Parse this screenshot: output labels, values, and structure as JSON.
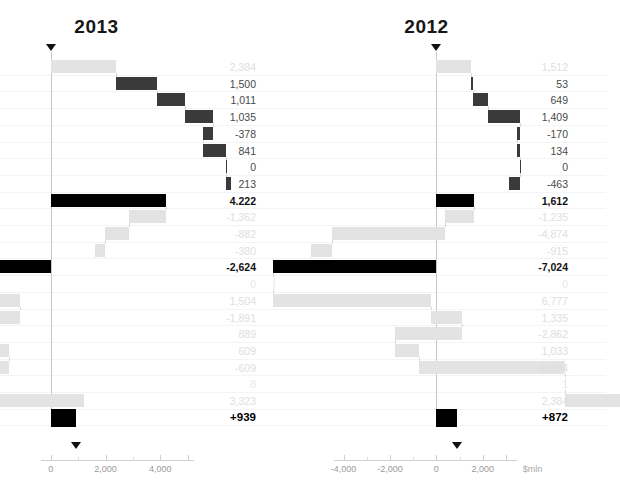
{
  "chart_data": {
    "type": "bar",
    "title": "",
    "subtitle": "",
    "xlabel": "$mln",
    "ylabel": "",
    "grid": true,
    "legend_position": "none",
    "panels": [
      {
        "name": "2013",
        "year_label": "2013",
        "axis_unit": "$mln",
        "xlim": [
          -1200,
          5200
        ],
        "xticks": [
          0,
          2000,
          4000
        ],
        "xtick_labels": [
          "0",
          "2,000",
          "4,000"
        ],
        "start_marker_value": 939,
        "total_label": "+939",
        "rows": [
          {
            "value": 2384,
            "label": "2,384",
            "style": "faint",
            "kind": "bar"
          },
          {
            "value": 1500,
            "label": "1,500",
            "style": "normal",
            "kind": "bar"
          },
          {
            "value": 1011,
            "label": "1,011",
            "style": "normal",
            "kind": "bar"
          },
          {
            "value": 1035,
            "label": "1,035",
            "style": "normal",
            "kind": "bar"
          },
          {
            "value": -378,
            "label": "-378",
            "style": "normal",
            "kind": "bar"
          },
          {
            "value": 841,
            "label": "841",
            "style": "normal",
            "kind": "bar"
          },
          {
            "value": 0,
            "label": "0",
            "style": "normal",
            "kind": "bar"
          },
          {
            "value": 213,
            "label": "213",
            "style": "normal",
            "kind": "bar"
          },
          {
            "value": 4222,
            "label": "4.222",
            "style": "total",
            "kind": "subtotal"
          },
          {
            "value": -1362,
            "label": "-1,362",
            "style": "faint",
            "kind": "bar"
          },
          {
            "value": -882,
            "label": "-882",
            "style": "faint",
            "kind": "bar"
          },
          {
            "value": -380,
            "label": "-380",
            "style": "faint",
            "kind": "bar"
          },
          {
            "value": -2624,
            "label": "-2,624",
            "style": "total",
            "kind": "subtotal"
          },
          {
            "value": 0,
            "label": "0",
            "style": "faint2",
            "kind": "bar"
          },
          {
            "value": 1504,
            "label": "1,504",
            "style": "faint",
            "kind": "bar"
          },
          {
            "value": -1891,
            "label": "-1,891",
            "style": "faint",
            "kind": "bar"
          },
          {
            "value": 889,
            "label": "889",
            "style": "faint",
            "kind": "bar"
          },
          {
            "value": 609,
            "label": "609",
            "style": "faint",
            "kind": "bar"
          },
          {
            "value": -609,
            "label": "-609",
            "style": "faint",
            "kind": "bar"
          },
          {
            "value": 8,
            "label": "8",
            "style": "faint2",
            "kind": "bar"
          },
          {
            "value": 3323,
            "label": "3,323",
            "style": "faint",
            "kind": "bar"
          },
          {
            "value": 939,
            "label": "+939",
            "style": "grand",
            "kind": "total"
          }
        ]
      },
      {
        "name": "2012",
        "year_label": "2012",
        "axis_unit": "$mln",
        "xlim": [
          -5400,
          3000
        ],
        "xticks": [
          -4000,
          -2000,
          0,
          2000
        ],
        "xtick_labels": [
          "-4,000",
          "-2,000",
          "0",
          "2,000"
        ],
        "start_marker_value": 872,
        "total_label": "+872",
        "rows": [
          {
            "value": 1512,
            "label": "1,512",
            "style": "faint",
            "kind": "bar"
          },
          {
            "value": 53,
            "label": "53",
            "style": "normal",
            "kind": "bar"
          },
          {
            "value": 649,
            "label": "649",
            "style": "normal",
            "kind": "bar"
          },
          {
            "value": 1409,
            "label": "1,409",
            "style": "normal",
            "kind": "bar"
          },
          {
            "value": -170,
            "label": "-170",
            "style": "normal",
            "kind": "bar"
          },
          {
            "value": 134,
            "label": "134",
            "style": "normal",
            "kind": "bar"
          },
          {
            "value": 0,
            "label": "0",
            "style": "normal",
            "kind": "bar"
          },
          {
            "value": -463,
            "label": "-463",
            "style": "normal",
            "kind": "bar"
          },
          {
            "value": 1612,
            "label": "1,612",
            "style": "total",
            "kind": "subtotal"
          },
          {
            "value": -1235,
            "label": "-1,235",
            "style": "faint",
            "kind": "bar"
          },
          {
            "value": -4874,
            "label": "-4,874",
            "style": "faint",
            "kind": "bar"
          },
          {
            "value": -915,
            "label": "-915",
            "style": "faint",
            "kind": "bar"
          },
          {
            "value": -7024,
            "label": "-7,024",
            "style": "total",
            "kind": "subtotal"
          },
          {
            "value": 0,
            "label": "0",
            "style": "faint2",
            "kind": "bar"
          },
          {
            "value": 6777,
            "label": "6,777",
            "style": "faint",
            "kind": "bar"
          },
          {
            "value": 1335,
            "label": "1,335",
            "style": "faint",
            "kind": "bar"
          },
          {
            "value": -2862,
            "label": "-2,862",
            "style": "faint",
            "kind": "bar"
          },
          {
            "value": 1033,
            "label": "1,033",
            "style": "faint",
            "kind": "bar"
          },
          {
            "value": 6284,
            "label": "6,284",
            "style": "faint",
            "kind": "bar"
          },
          {
            "value": 1,
            "label": "1",
            "style": "faint2",
            "kind": "bar"
          },
          {
            "value": 2384,
            "label": "2,384",
            "style": "faint",
            "kind": "bar"
          },
          {
            "value": 872,
            "label": "+872",
            "style": "grand",
            "kind": "total"
          }
        ]
      }
    ]
  }
}
